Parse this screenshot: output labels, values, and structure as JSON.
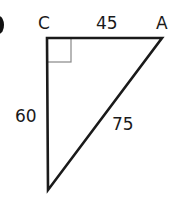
{
  "diagram": {
    "type": "right-triangle",
    "vertices": {
      "top_left": {
        "label": "C",
        "x": 47,
        "y": 38
      },
      "top_right": {
        "label": "A",
        "x": 162,
        "y": 38
      },
      "bottom": {
        "label": "",
        "x": 48,
        "y": 190
      }
    },
    "sides": {
      "top": "45",
      "left": "60",
      "hypotenuse": "75"
    },
    "right_angle_at": "C",
    "stroke_color": "#1a1a1a",
    "right_angle_marker_color": "#888888"
  }
}
